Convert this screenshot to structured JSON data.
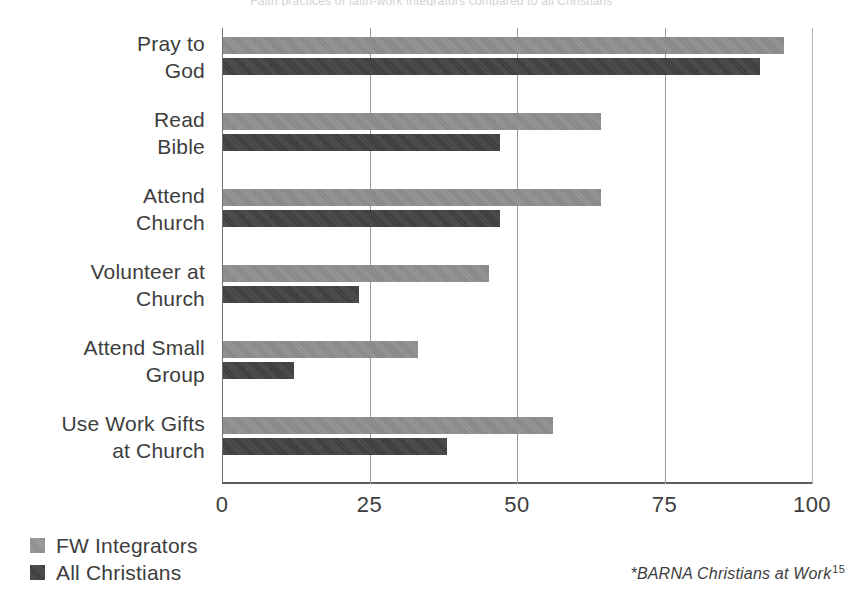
{
  "top_cut_text": "Faith practices of faith-work integrators compared to all Christians",
  "chart_data": {
    "type": "bar",
    "orientation": "horizontal",
    "title": "",
    "xlabel": "",
    "ylabel": "",
    "xlim": [
      0,
      100
    ],
    "xticks": [
      0,
      25,
      50,
      75,
      100
    ],
    "xtick_labels": [
      "0",
      "25",
      "50",
      "75",
      "100"
    ],
    "grid": true,
    "legend_position": "bottom-left",
    "categories": [
      "Pray to God",
      "Read Bible",
      "Attend Church",
      "Volunteer at Church",
      "Attend Small Group",
      "Use Work Gifts at Church"
    ],
    "category_lines": [
      [
        "Pray to",
        "God"
      ],
      [
        "Read",
        "Bible"
      ],
      [
        "Attend",
        "Church"
      ],
      [
        "Volunteer at",
        "Church"
      ],
      [
        "Attend Small",
        "Group"
      ],
      [
        "Use Work Gifts",
        "at Church"
      ]
    ],
    "series": [
      {
        "name": "FW Integrators",
        "color": "#858585",
        "values": [
          95,
          64,
          64,
          45,
          33,
          56
        ]
      },
      {
        "name": "All Christians",
        "color": "#3a3a3a",
        "values": [
          91,
          47,
          47,
          23,
          12,
          38
        ]
      }
    ]
  },
  "legend": {
    "items": [
      {
        "label": "FW Integrators",
        "swatch": "light-gray-swatch"
      },
      {
        "label": "All Christians",
        "swatch": "dark-gray-swatch"
      }
    ]
  },
  "footnote": {
    "text": "*BARNA Christians at Work",
    "superscript": "15"
  }
}
